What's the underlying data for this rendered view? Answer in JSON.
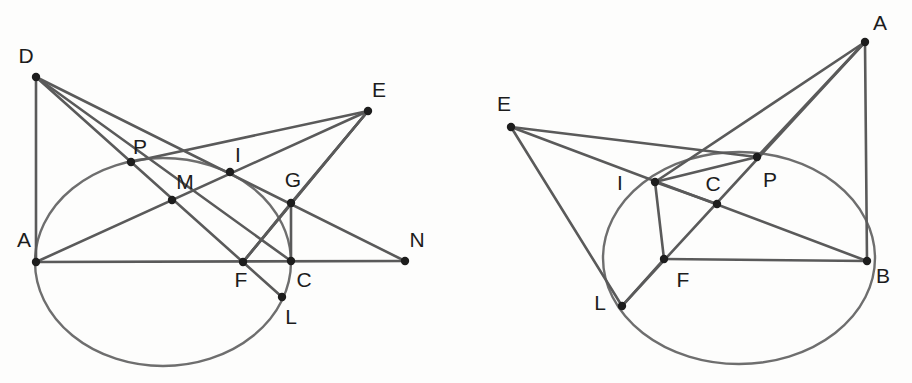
{
  "figure": {
    "background_color": "#fdfdfc",
    "stroke_color": "#5a5a5a",
    "conic_color": "#6e6e6e",
    "vertex_color": "#1d1d1d",
    "label_color": "#1c1c1c",
    "width": 912,
    "height": 383
  },
  "panels": [
    {
      "id": "left",
      "conic": {
        "cx": 163,
        "cy": 262,
        "rx": 128,
        "ry": 104
      },
      "points": [
        {
          "name": "D",
          "x": 36,
          "y": 77,
          "lx": 26,
          "ly": 57,
          "dot": true
        },
        {
          "name": "E",
          "x": 368,
          "y": 111,
          "lx": 379,
          "ly": 91,
          "dot": true
        },
        {
          "name": "P",
          "x": 131,
          "y": 162,
          "lx": 140,
          "ly": 148,
          "dot": true
        },
        {
          "name": "I",
          "x": 230,
          "y": 172,
          "lx": 238,
          "ly": 156,
          "dot": true
        },
        {
          "name": "M",
          "x": 172,
          "y": 200,
          "lx": 185,
          "ly": 183,
          "dot": true
        },
        {
          "name": "G",
          "x": 291,
          "y": 203,
          "lx": 293,
          "ly": 181,
          "dot": true
        },
        {
          "name": "A",
          "x": 36,
          "y": 262,
          "lx": 24,
          "ly": 241,
          "dot": true
        },
        {
          "name": "N",
          "x": 405,
          "y": 261,
          "lx": 417,
          "ly": 241,
          "dot": true
        },
        {
          "name": "F",
          "x": 243,
          "y": 262,
          "lx": 241,
          "ly": 281,
          "dot": true
        },
        {
          "name": "C",
          "x": 291,
          "y": 261,
          "lx": 304,
          "ly": 281,
          "dot": true
        },
        {
          "name": "L",
          "x": 282,
          "y": 297,
          "lx": 291,
          "ly": 318,
          "dot": true
        }
      ],
      "segments": [
        [
          "D",
          "A"
        ],
        [
          "D",
          "N"
        ],
        [
          "D",
          "C"
        ],
        [
          "A",
          "E"
        ],
        [
          "A",
          "N"
        ],
        [
          "P",
          "E"
        ],
        [
          "E",
          "F"
        ],
        [
          "E",
          "G"
        ],
        [
          "D",
          "L"
        ],
        [
          "G",
          "C"
        ],
        [
          "F",
          "G"
        ],
        [
          "F",
          "E"
        ]
      ]
    },
    {
      "id": "right",
      "conic": {
        "cx": 739,
        "cy": 258,
        "rx": 136,
        "ry": 106
      },
      "points": [
        {
          "name": "A",
          "x": 865,
          "y": 42,
          "lx": 880,
          "ly": 24,
          "dot": true
        },
        {
          "name": "E",
          "x": 511,
          "y": 127,
          "lx": 504,
          "ly": 105,
          "dot": true
        },
        {
          "name": "P",
          "x": 757,
          "y": 157,
          "lx": 770,
          "ly": 181,
          "dot": true
        },
        {
          "name": "I",
          "x": 655,
          "y": 182,
          "lx": 620,
          "ly": 184,
          "dot": true
        },
        {
          "name": "C",
          "x": 717,
          "y": 204,
          "lx": 713,
          "ly": 185,
          "dot": true
        },
        {
          "name": "F",
          "x": 664,
          "y": 259,
          "lx": 683,
          "ly": 281,
          "dot": true
        },
        {
          "name": "B",
          "x": 867,
          "y": 261,
          "lx": 883,
          "ly": 277,
          "dot": true
        },
        {
          "name": "L",
          "x": 622,
          "y": 306,
          "lx": 600,
          "ly": 304,
          "dot": true
        }
      ],
      "segments": [
        [
          "A",
          "B"
        ],
        [
          "A",
          "I"
        ],
        [
          "A",
          "L"
        ],
        [
          "E",
          "P"
        ],
        [
          "E",
          "B"
        ],
        [
          "E",
          "L"
        ],
        [
          "I",
          "F"
        ],
        [
          "F",
          "B"
        ],
        [
          "F",
          "L"
        ],
        [
          "I",
          "P"
        ],
        [
          "A",
          "P"
        ],
        [
          "I",
          "C"
        ]
      ]
    }
  ]
}
